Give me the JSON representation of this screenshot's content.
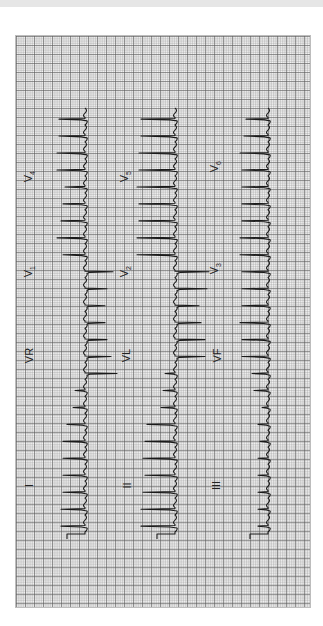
{
  "image": {
    "type": "12-lead ECG strip (rotated 90° counter-clockwise)",
    "colors": {
      "trace": "#1a1a1a",
      "grid_major": "#8a8a8a",
      "grid_minor": "#c8c8c8",
      "paper": "#f4f4f4",
      "top_bar": "#e6e6e6"
    }
  },
  "leads": {
    "row1": [
      {
        "name": "I",
        "label": "I"
      },
      {
        "name": "aVR",
        "label": "VR"
      },
      {
        "name": "V1",
        "label": "V",
        "sub": "1"
      },
      {
        "name": "V4",
        "label": "V",
        "sub": "4"
      }
    ],
    "row2": [
      {
        "name": "II",
        "label": "II"
      },
      {
        "name": "aVL",
        "label": "VL"
      },
      {
        "name": "V2",
        "label": "V",
        "sub": "2"
      },
      {
        "name": "V5",
        "label": "V",
        "sub": "5"
      }
    ],
    "row3": [
      {
        "name": "III",
        "label": "III"
      },
      {
        "name": "aVF",
        "label": "VF"
      },
      {
        "name": "V3",
        "label": "V",
        "sub": "3"
      },
      {
        "name": "V6",
        "label": "V",
        "sub": "6"
      }
    ]
  },
  "traces": [
    {
      "baseline_x": 85,
      "amplitudes": [
        -26,
        -26,
        -28,
        -28,
        -20,
        -22,
        -24,
        -28,
        -22,
        28,
        22,
        20,
        20,
        22,
        26,
        32,
        -10,
        -12,
        -18,
        -22,
        -22,
        -22,
        -22,
        -24,
        -24
      ]
    },
    {
      "baseline_x": 175,
      "amplitudes": [
        -34,
        -34,
        -36,
        -36,
        -38,
        -36,
        -36,
        -38,
        -38,
        34,
        32,
        24,
        26,
        30,
        30,
        -10,
        -12,
        -14,
        -28,
        -30,
        -32,
        -30,
        -32,
        -34,
        -34
      ]
    },
    {
      "baseline_x": 268,
      "amplitudes": [
        -22,
        -24,
        -28,
        -26,
        -26,
        -26,
        -26,
        -28,
        -28,
        -26,
        -26,
        -26,
        -28,
        -26,
        -26,
        -16,
        -14,
        -6,
        -10,
        -8,
        -10,
        -10,
        -10,
        -10,
        -10
      ]
    }
  ]
}
